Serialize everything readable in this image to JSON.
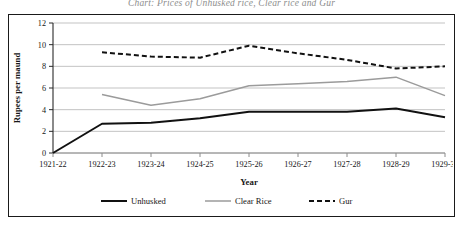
{
  "figure": {
    "title_clipped": "Chart: Prices of Unhusked rice, Clear rice and Gur",
    "background": "#ffffff",
    "frame_color": "#1a1a1a"
  },
  "chart_data": {
    "type": "line",
    "title": "",
    "xlabel": "Year",
    "ylabel": "Rupees per maund",
    "categories": [
      "1921-22",
      "1922-23",
      "1923-24",
      "1924-25",
      "1925-26",
      "1926-27",
      "1927-28",
      "1928-29",
      "1929-30"
    ],
    "ylim": [
      0,
      12
    ],
    "yticks": [
      0,
      2,
      4,
      6,
      8,
      10,
      12
    ],
    "grid": true,
    "legend_position": "bottom",
    "series": [
      {
        "name": "Unhusked",
        "color": "#111111",
        "width": 2.0,
        "dash": "none",
        "values": [
          0,
          2.7,
          2.8,
          3.2,
          3.8,
          3.8,
          3.8,
          4.1,
          3.3
        ]
      },
      {
        "name": "Clear Rice",
        "color": "#9b9b9b",
        "width": 1.5,
        "dash": "none",
        "values": [
          null,
          5.4,
          4.4,
          5.0,
          6.2,
          6.4,
          6.6,
          7.0,
          5.3
        ]
      },
      {
        "name": "Gur",
        "color": "#111111",
        "width": 2.0,
        "dash": "dashed",
        "values": [
          null,
          9.3,
          8.9,
          8.8,
          9.9,
          9.2,
          8.6,
          7.8,
          8.0
        ]
      }
    ]
  }
}
